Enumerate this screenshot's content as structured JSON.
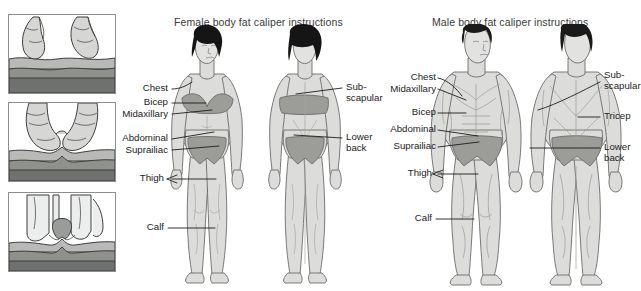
{
  "document": {
    "kind": "anatomy-illustration",
    "background_color": "#ffffff",
    "ink_color": "#1c1c1c",
    "skin_fill": "#d9dad7",
    "shade_fill": "#9a9a97",
    "hair_fill": "#1a1a1a",
    "outline_color": "#5a5a5a"
  },
  "panels": {
    "caliper_steps": {
      "name": "caliper pinch sequence",
      "steps": [
        {
          "id": "step-1",
          "caption": ""
        },
        {
          "id": "step-2",
          "caption": ""
        },
        {
          "id": "step-3",
          "caption": ""
        }
      ]
    },
    "female": {
      "title": "Female body fat caliper instructions",
      "front_labels": [
        {
          "id": "chest",
          "text": "Chest"
        },
        {
          "id": "bicep",
          "text": "Bicep"
        },
        {
          "id": "midaxillary",
          "text": "Midaxillary"
        },
        {
          "id": "abdominal",
          "text": "Abdominal"
        },
        {
          "id": "suprailiac",
          "text": "Suprailiac"
        },
        {
          "id": "thigh",
          "text": "Thigh"
        },
        {
          "id": "calf",
          "text": "Calf"
        }
      ],
      "back_labels": [
        {
          "id": "subscapular",
          "line1": "Sub-",
          "line2": "scapular"
        },
        {
          "id": "lower-back",
          "line1": "Lower",
          "line2": "back"
        }
      ]
    },
    "male": {
      "title": "Male body fat caliper instructions",
      "front_labels": [
        {
          "id": "chest",
          "text": "Chest"
        },
        {
          "id": "midaxillary",
          "text": "Midaxillary"
        },
        {
          "id": "bicep",
          "text": "Bicep"
        },
        {
          "id": "abdominal",
          "text": "Abdominal"
        },
        {
          "id": "suprailiac",
          "text": "Suprailiac"
        },
        {
          "id": "thigh",
          "text": "Thigh"
        },
        {
          "id": "calf",
          "text": "Calf"
        }
      ],
      "back_labels": [
        {
          "id": "subscapular",
          "line1": "Sub-",
          "line2": "scapular"
        },
        {
          "id": "tricep",
          "line1": "Tricep",
          "line2": ""
        },
        {
          "id": "lower-back",
          "line1": "Lower",
          "line2": "back"
        }
      ]
    }
  }
}
